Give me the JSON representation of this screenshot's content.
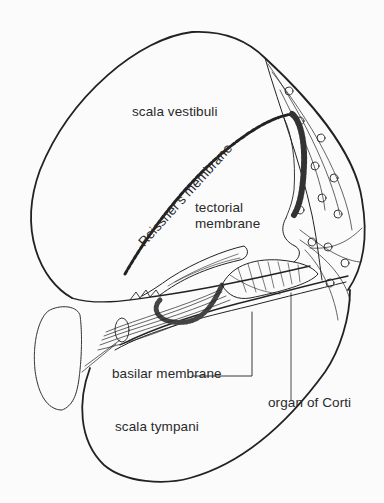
{
  "figure": {
    "labels": {
      "scala_vestibuli": "scala vestibuli",
      "reissners_membrane": "Reissner's membrane",
      "tectorial_line1": "tectorial",
      "tectorial_line2": "membrane",
      "basilar_membrane": "basilar membrane",
      "organ_of_corti": "organ of Corti",
      "scala_tympani": "scala tympani"
    },
    "colors": {
      "ink": "#222222",
      "paper": "#fbfbfb"
    }
  }
}
